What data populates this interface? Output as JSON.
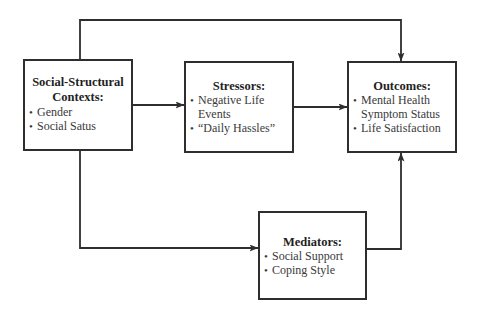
{
  "diagram": {
    "type": "flow-model",
    "colors": {
      "line": "#2e2e2e",
      "text": "#2b2b2b",
      "background": "#ffffff"
    },
    "nodes": [
      {
        "id": "context",
        "title": "Social-Structural Contexts:",
        "title_lines": [
          "Social-Structural",
          "Contexts:"
        ],
        "items": [
          "Gender",
          "Social Satus"
        ]
      },
      {
        "id": "stressors",
        "title": "Stressors:",
        "items": [
          "Negative Life Events",
          "“Daily Hassles”"
        ]
      },
      {
        "id": "outcomes",
        "title": "Outcomes:",
        "items": [
          "Mental Health Symptom Status",
          "Life Satisfaction"
        ]
      },
      {
        "id": "mediators",
        "title": "Mediators:",
        "items": [
          "Social Support",
          "Coping Style"
        ]
      }
    ],
    "edges": [
      {
        "from": "context",
        "to": "stressors",
        "label": ""
      },
      {
        "from": "stressors",
        "to": "outcomes",
        "label": ""
      },
      {
        "from": "context",
        "to": "outcomes",
        "route": "over-top",
        "label": ""
      },
      {
        "from": "context",
        "to": "mediators",
        "route": "down-then-right",
        "label": ""
      },
      {
        "from": "mediators",
        "to": "outcomes",
        "route": "right-then-up",
        "label": ""
      }
    ]
  }
}
